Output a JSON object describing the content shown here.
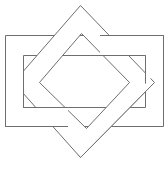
{
  "figure": {
    "stroke_color": "#6e6e6e",
    "fill_color": "#ffffff",
    "stroke_width": 1,
    "rect_frame": {
      "outer": {
        "x": 5,
        "y": 35,
        "w": 158,
        "h": 91
      },
      "inner": {
        "x": 23,
        "y": 55,
        "w": 122,
        "h": 52
      }
    },
    "diamond_frame": {
      "outer": [
        [
          80,
          5
        ],
        [
          154,
          82
        ],
        [
          80,
          157
        ],
        [
          13,
          82
        ]
      ],
      "inner": [
        [
          81,
          33
        ],
        [
          129,
          82
        ],
        [
          86,
          128
        ],
        [
          39,
          82
        ]
      ]
    }
  },
  "caption": {
    "text": ""
  }
}
